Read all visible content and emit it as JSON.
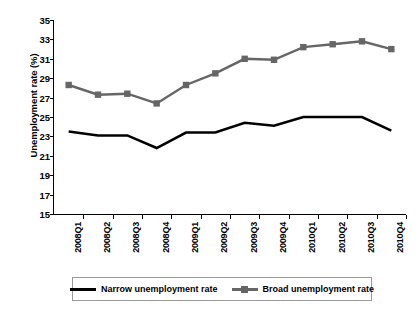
{
  "chart_data": {
    "type": "line",
    "title": "",
    "xlabel": "",
    "ylabel": "Unemployment rate (%)",
    "ylim": [
      15,
      35
    ],
    "ytick_step": 2,
    "yticks": [
      35,
      33,
      31,
      29,
      27,
      25,
      23,
      21,
      19,
      17,
      15
    ],
    "grid": false,
    "legend_position": "bottom",
    "categories": [
      "2008Q1",
      "2008Q2",
      "2008Q3",
      "2008Q4",
      "2009Q1",
      "2009Q2",
      "2009Q3",
      "2009Q4",
      "2010Q1",
      "2010Q2",
      "2010Q3",
      "2010Q4"
    ],
    "series": [
      {
        "name": "Narrow unemployment rate",
        "color": "#000000",
        "marker": "none",
        "values": [
          23.5,
          23.1,
          23.1,
          21.8,
          23.4,
          23.4,
          24.4,
          24.1,
          25.0,
          25.0,
          25.0,
          23.6
        ]
      },
      {
        "name": "Broad unemployment rate",
        "color": "#666666",
        "marker": "square",
        "values": [
          28.3,
          27.3,
          27.4,
          26.4,
          28.3,
          29.5,
          31.0,
          30.9,
          32.2,
          32.5,
          32.8,
          32.0
        ]
      }
    ]
  },
  "axis": {
    "y_title": "Unemployment rate (%)"
  },
  "legend": {
    "entries": [
      {
        "label": "Narrow unemployment rate",
        "swatch": "line-black"
      },
      {
        "label": "Broad unemployment rate",
        "swatch": "line-gray-square"
      }
    ]
  },
  "colors": {
    "narrow": "#000000",
    "broad": "#666666",
    "axis": "#000000",
    "legend_border": "#9a9a9a",
    "background": "#ffffff"
  }
}
